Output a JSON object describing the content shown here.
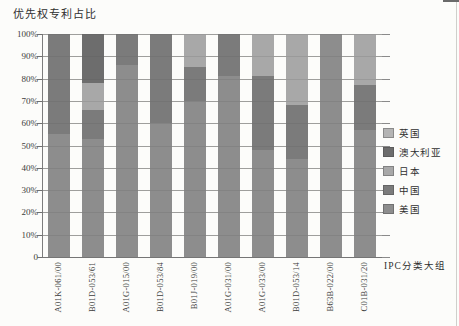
{
  "page": {
    "background": "#fcfcfa"
  },
  "chart_data": {
    "type": "bar",
    "variant": "stacked-100-percent-column",
    "title": "优先权专利占比",
    "xlabel": "IPC分类大组",
    "ylabel": "",
    "ylim": [
      0,
      100
    ],
    "grid": "horizontal",
    "legend_position": "right",
    "categories": [
      "A01K-061/00",
      "B01D-053/61",
      "A01G-015/00",
      "B01D-053/84",
      "B01J-019/00",
      "A01G-031/00",
      "A01G-033/00",
      "B01D-053/14",
      "B63B-022/00",
      "C01B-031/20"
    ],
    "series": [
      {
        "name": "美国",
        "color": "#8d8d8d",
        "values": [
          55,
          53,
          86,
          60,
          70,
          81,
          48,
          44,
          100,
          57
        ]
      },
      {
        "name": "中国",
        "color": "#7b7b7b",
        "values": [
          45,
          13,
          14,
          40,
          15,
          19,
          33,
          24,
          0,
          20
        ]
      },
      {
        "name": "日本",
        "color": "#a8a8a8",
        "values": [
          0,
          12,
          0,
          0,
          15,
          0,
          19,
          32,
          0,
          23
        ]
      },
      {
        "name": "澳大利亚",
        "color": "#6d6d6d",
        "values": [
          0,
          22,
          0,
          0,
          0,
          0,
          0,
          0,
          0,
          0
        ]
      },
      {
        "name": "英国",
        "color": "#b4b4b4",
        "values": [
          0,
          0,
          0,
          0,
          0,
          0,
          0,
          0,
          0,
          0
        ]
      }
    ],
    "stack_order_bottom_to_top": [
      "美国",
      "中国",
      "日本",
      "澳大利亚",
      "英国"
    ],
    "legend_top_to_bottom": [
      "英国",
      "澳大利亚",
      "日本",
      "中国",
      "美国"
    ],
    "yticks": [
      "100%",
      "90%",
      "80%",
      "70%",
      "60%",
      "50%",
      "40%",
      "30%",
      "20%",
      "10%",
      "0"
    ]
  }
}
